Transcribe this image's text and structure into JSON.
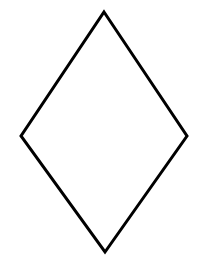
{
  "canvas": {
    "width": 201,
    "height": 259,
    "background_color": "#ffffff",
    "title": "Rhombus Outline"
  },
  "figure": {
    "name": "rhombus",
    "alt_names": [
      "diamond",
      "kite",
      "lozenge"
    ],
    "style": {
      "stroke_color": "#000000",
      "stroke_width": 3,
      "fill": "none",
      "line_join": "miter",
      "closed": true
    },
    "vertices": [
      {
        "label": "top",
        "x": 104,
        "y": 12
      },
      {
        "label": "right",
        "x": 187,
        "y": 136
      },
      {
        "label": "bottom",
        "x": 105,
        "y": 252
      },
      {
        "label": "left",
        "x": 21,
        "y": 136
      }
    ],
    "points_attr": "104,12 187,136 105,252 21,136",
    "metrics": {
      "horizontal_diagonal": 166,
      "vertical_diagonal": 240,
      "center_x": 104,
      "center_y": 132
    }
  }
}
